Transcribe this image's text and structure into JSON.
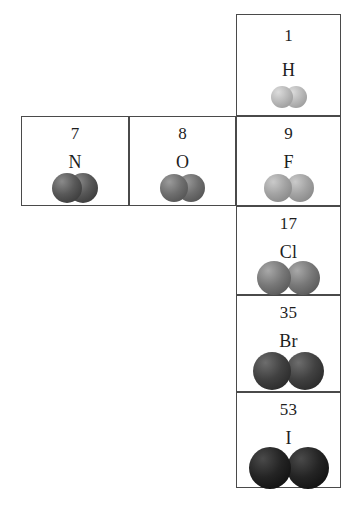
{
  "figure": {
    "cells": [
      {
        "id": "h",
        "atomic_number": "1",
        "symbol": "H",
        "molecule": "H2",
        "atom_count": 2,
        "atom_radius_px": 11,
        "overlap_px": 8,
        "color_light": "#dcdcdc",
        "color_mid": "#b9b9b9",
        "color_dark": "#8e8e8e"
      },
      {
        "id": "n",
        "atomic_number": "7",
        "symbol": "N",
        "molecule": "N2",
        "atom_count": 2,
        "atom_radius_px": 15,
        "overlap_px": 14,
        "color_light": "#8a8a8a",
        "color_mid": "#585858",
        "color_dark": "#2e2e2e"
      },
      {
        "id": "o",
        "atomic_number": "8",
        "symbol": "O",
        "molecule": "O2",
        "atom_count": 2,
        "atom_radius_px": 14,
        "overlap_px": 11,
        "color_light": "#9b9b9b",
        "color_mid": "#6f6f6f",
        "color_dark": "#474747"
      },
      {
        "id": "f",
        "atomic_number": "9",
        "symbol": "F",
        "molecule": "F2",
        "atom_count": 2,
        "atom_radius_px": 14,
        "overlap_px": 6,
        "color_light": "#cacaca",
        "color_mid": "#a3a3a3",
        "color_dark": "#7c7c7c"
      },
      {
        "id": "cl",
        "atomic_number": "17",
        "symbol": "Cl",
        "molecule": "Cl2",
        "atom_count": 2,
        "atom_radius_px": 17,
        "overlap_px": 5,
        "color_light": "#a8a8a8",
        "color_mid": "#787878",
        "color_dark": "#4a4a4a"
      },
      {
        "id": "br",
        "atomic_number": "35",
        "symbol": "Br",
        "molecule": "Br2",
        "atom_count": 2,
        "atom_radius_px": 19,
        "overlap_px": 5,
        "color_light": "#6d6d6d",
        "color_mid": "#414141",
        "color_dark": "#1f1f1f"
      },
      {
        "id": "i",
        "atomic_number": "53",
        "symbol": "I",
        "molecule": "I2",
        "atom_count": 2,
        "atom_radius_px": 21,
        "overlap_px": 4,
        "color_light": "#4a4a4a",
        "color_mid": "#242424",
        "color_dark": "#080808"
      }
    ]
  }
}
